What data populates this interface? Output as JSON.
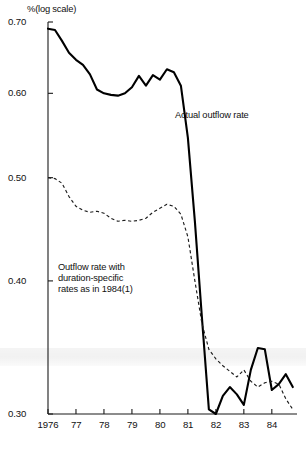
{
  "figure": {
    "axis_unit_label": "%(log scale)",
    "y_ticks": [
      "0.70",
      "0.60",
      "0.50",
      "0.40",
      "0.30"
    ],
    "x_ticks": [
      "1976",
      "77",
      "78",
      "79",
      "80",
      "81",
      "82",
      "83",
      "84"
    ],
    "annotation_solid": "Actual outflow rate",
    "annotation_dashed_line1": "Outflow rate with",
    "annotation_dashed_line2": "duration-specific",
    "annotation_dashed_line3": "rates as in 1984(1)",
    "color_ink": "#000000",
    "color_paper": "#ffffff"
  },
  "chart_data": {
    "type": "line",
    "title": "",
    "subtitle": "",
    "xlabel": "",
    "ylabel": "%(log scale)",
    "yscale": "log",
    "ylim": [
      0.3,
      0.7
    ],
    "xlim": [
      1976.0,
      1984.9
    ],
    "grid": false,
    "legend": "inline-annotations",
    "ytick_values": [
      0.7,
      0.6,
      0.5,
      0.4,
      0.3
    ],
    "ytick_labels": [
      "0.70",
      "0.60",
      "0.50",
      "0.40",
      "0.30"
    ],
    "xtick_values": [
      1976,
      1977,
      1978,
      1979,
      1980,
      1981,
      1982,
      1983,
      1984
    ],
    "xtick_labels": [
      "1976",
      "77",
      "78",
      "79",
      "80",
      "81",
      "82",
      "83",
      "84"
    ],
    "annotations": [
      {
        "text": "Actual outflow rate",
        "x": 1981.1,
        "y": 0.555,
        "series": "Actual outflow rate"
      },
      {
        "text": "Outflow rate with duration-specific rates as in 1984(1)",
        "x": 1977.3,
        "y": 0.432,
        "series": "Outflow rate with duration-specific rates as in 1984(1)"
      }
    ],
    "series": [
      {
        "name": "Actual outflow rate",
        "style": "solid",
        "x": [
          1976.0,
          1976.25,
          1976.5,
          1976.75,
          1977.0,
          1977.25,
          1977.5,
          1977.75,
          1978.0,
          1978.25,
          1978.5,
          1978.75,
          1979.0,
          1979.25,
          1979.5,
          1979.75,
          1980.0,
          1980.25,
          1980.5,
          1980.75,
          1981.0,
          1981.25,
          1981.5,
          1981.75,
          1982.0,
          1982.25,
          1982.5,
          1982.75,
          1983.0,
          1983.25,
          1983.5,
          1983.75,
          1984.0,
          1984.25,
          1984.5,
          1984.75
        ],
        "values": [
          0.69,
          0.688,
          0.672,
          0.655,
          0.645,
          0.638,
          0.625,
          0.605,
          0.6,
          0.598,
          0.597,
          0.6,
          0.608,
          0.623,
          0.61,
          0.624,
          0.618,
          0.632,
          0.628,
          0.61,
          0.545,
          0.455,
          0.37,
          0.303,
          0.3,
          0.312,
          0.318,
          0.313,
          0.306,
          0.33,
          0.346,
          0.345,
          0.316,
          0.32,
          0.327,
          0.318
        ]
      },
      {
        "name": "Outflow rate with duration-specific rates as in 1984(1)",
        "style": "dashed",
        "x": [
          1976.0,
          1976.25,
          1976.5,
          1976.75,
          1977.0,
          1977.25,
          1977.5,
          1977.75,
          1978.0,
          1978.25,
          1978.5,
          1978.75,
          1979.0,
          1979.25,
          1979.5,
          1979.75,
          1980.0,
          1980.25,
          1980.5,
          1980.75,
          1981.0,
          1981.25,
          1981.5,
          1981.75,
          1982.0,
          1982.25,
          1982.5,
          1982.75,
          1983.0,
          1983.25,
          1983.5,
          1983.75,
          1984.0,
          1984.25,
          1984.5,
          1984.75
        ],
        "values": [
          0.5,
          0.499,
          0.494,
          0.48,
          0.47,
          0.466,
          0.464,
          0.465,
          0.463,
          0.458,
          0.455,
          0.456,
          0.455,
          0.456,
          0.458,
          0.464,
          0.468,
          0.472,
          0.47,
          0.462,
          0.44,
          0.4,
          0.365,
          0.345,
          0.338,
          0.333,
          0.329,
          0.325,
          0.33,
          0.322,
          0.318,
          0.321,
          0.322,
          0.32,
          0.31,
          0.303
        ]
      }
    ]
  }
}
